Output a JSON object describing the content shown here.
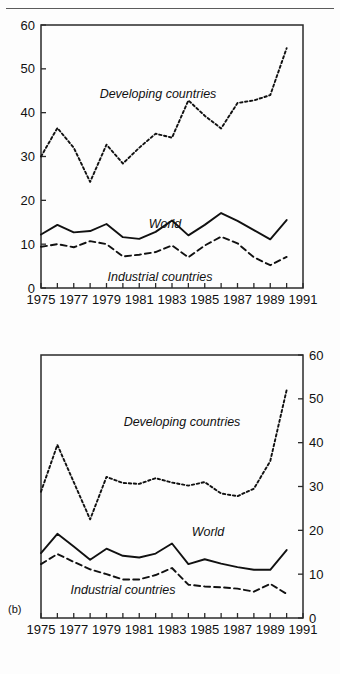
{
  "page": {
    "background": "#fdfdfd",
    "rule_color": "#5a5a5a"
  },
  "panels": {
    "b_label": "(b)"
  },
  "labels": {
    "developing": "Developing countries",
    "world": "World",
    "industrial": "Industrial countries"
  },
  "axis": {
    "x_ticks_all": [
      1975,
      1976,
      1977,
      1978,
      1979,
      1980,
      1981,
      1982,
      1983,
      1984,
      1985,
      1986,
      1987,
      1988,
      1989,
      1990,
      1991
    ],
    "x_tick_labels": [
      "1975",
      "1977",
      "1979",
      "1981",
      "1983",
      "1985",
      "1987",
      "1989",
      "1991"
    ],
    "x_tick_label_years": [
      1975,
      1977,
      1979,
      1981,
      1983,
      1985,
      1987,
      1989,
      1991
    ],
    "y_tick_labels": [
      "0",
      "10",
      "20",
      "30",
      "40",
      "50",
      "60"
    ],
    "y_tick_values": [
      0,
      10,
      20,
      30,
      40,
      50,
      60
    ],
    "xlim": [
      1975,
      1991
    ],
    "ylim": [
      0,
      60
    ]
  },
  "chart_data": [
    {
      "id": "chart-a",
      "type": "line",
      "title": "",
      "xlabel": "",
      "ylabel": "",
      "xlim": [
        1975,
        1991
      ],
      "ylim": [
        0,
        60
      ],
      "grid": false,
      "y_axis_position": "left",
      "legend_position": "inline-annotation",
      "x": [
        1975,
        1976,
        1977,
        1978,
        1979,
        1980,
        1981,
        1982,
        1983,
        1984,
        1985,
        1986,
        1987,
        1988,
        1989,
        1990
      ],
      "series": [
        {
          "name": "Developing countries",
          "style": "dotted",
          "values": [
            30.0,
            36.5,
            32.0,
            24.2,
            32.7,
            28.4,
            32.0,
            35.2,
            34.3,
            42.8,
            39.3,
            36.4,
            42.2,
            42.8,
            44.0,
            54.7
          ]
        },
        {
          "name": "World",
          "style": "solid",
          "values": [
            12.2,
            14.4,
            12.7,
            13.0,
            14.6,
            11.6,
            11.2,
            12.8,
            15.4,
            12.0,
            14.4,
            17.1,
            15.3,
            13.2,
            11.1,
            15.5
          ]
        },
        {
          "name": "Industrial countries",
          "style": "dashed",
          "values": [
            9.4,
            10.0,
            9.3,
            10.7,
            10.0,
            7.2,
            7.6,
            8.2,
            9.7,
            7.0,
            9.7,
            11.7,
            10.2,
            7.0,
            5.2,
            7.1
          ]
        }
      ]
    },
    {
      "id": "chart-b",
      "type": "line",
      "title": "",
      "xlabel": "",
      "ylabel": "",
      "xlim": [
        1975,
        1991
      ],
      "ylim": [
        0,
        60
      ],
      "grid": false,
      "y_axis_position": "right",
      "legend_position": "inline-annotation",
      "x": [
        1975,
        1976,
        1977,
        1978,
        1979,
        1980,
        1981,
        1982,
        1983,
        1984,
        1985,
        1986,
        1987,
        1988,
        1989,
        1990
      ],
      "series": [
        {
          "name": "Developing countries",
          "style": "dotted",
          "values": [
            28.8,
            39.5,
            31.0,
            22.5,
            32.2,
            30.8,
            30.6,
            31.9,
            30.9,
            30.2,
            31.0,
            28.4,
            27.8,
            29.5,
            35.8,
            52.0
          ]
        },
        {
          "name": "World",
          "style": "solid",
          "values": [
            14.8,
            19.2,
            16.3,
            13.3,
            15.8,
            14.2,
            13.8,
            14.7,
            17.0,
            12.3,
            13.4,
            12.4,
            11.6,
            11.0,
            11.0,
            15.5
          ]
        },
        {
          "name": "Industrial countries",
          "style": "dashed",
          "values": [
            12.3,
            14.6,
            12.8,
            11.1,
            10.0,
            8.8,
            8.8,
            9.8,
            11.4,
            7.6,
            7.2,
            7.0,
            6.7,
            6.0,
            7.8,
            5.5
          ]
        }
      ]
    }
  ]
}
